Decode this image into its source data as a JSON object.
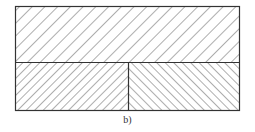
{
  "figure": {
    "caption": "b)",
    "outer_box": {
      "x": 15.5,
      "y": 6.5,
      "w": 224,
      "h": 104
    },
    "divider_y": 62.5,
    "divider_x": 128.5,
    "stroke_color": "#333333",
    "hatch_color": "#6a6a6a",
    "panels": [
      {
        "name": "top-panel",
        "hatch_direction": "backslash",
        "spacing": 9
      },
      {
        "name": "bottom-left-panel",
        "hatch_direction": "backslash",
        "spacing": 6
      },
      {
        "name": "bottom-right-panel",
        "hatch_direction": "slash",
        "spacing": 6
      }
    ]
  }
}
